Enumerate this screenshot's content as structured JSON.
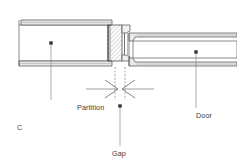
{
  "figure": {
    "id_label": "C",
    "type": "technical-cross-section",
    "background_color": "#ffffff",
    "line_color": "#4d4d4d",
    "hatch_color": "#8a8a8a",
    "fill_color": "#f2f2f2",
    "text_color": "#3c3c3c"
  },
  "labels": {
    "partition": "Partition",
    "door": "Door",
    "gap": "Gap"
  },
  "components": {
    "partition": {
      "name": "Partition",
      "x_start": 19,
      "x_end": 110,
      "y_top": 20,
      "y_bottom": 66,
      "top_band_thickness": 5,
      "bottom_band_thickness": 5
    },
    "jamb": {
      "name": "Hatched frame block",
      "x_start": 108,
      "x_end": 122,
      "y_top": 29,
      "y_bottom": 63,
      "hatched": true
    },
    "stop": {
      "name": "Door stop",
      "x_start": 122,
      "x_end": 130,
      "y_top": 31,
      "y_bottom": 61
    },
    "door": {
      "name": "Door",
      "x_start": 130,
      "x_end": 237,
      "y_top": 37,
      "y_bottom": 62,
      "top_band_thickness": 4,
      "bottom_band_thickness": 4
    },
    "gap": {
      "name": "Gap",
      "center_x": 120,
      "dimension_line_y": 89,
      "arrow_left_x": 86,
      "arrow_right_x": 154
    }
  },
  "leaders": {
    "partition": {
      "dot_x": 51,
      "dot_y": 43,
      "line_to_y": 100
    },
    "door": {
      "dot_x": 196,
      "dot_y": 52,
      "line_to_y": 108
    },
    "gap": {
      "dot_x": 120,
      "dot_y": 106,
      "line_to_y": 146
    }
  }
}
